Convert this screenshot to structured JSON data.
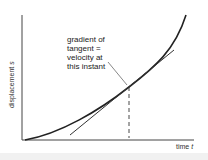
{
  "diagram": {
    "annotation_lines": [
      "gradient of",
      "tangent =",
      "velocity at",
      "this instant"
    ],
    "x_axis": {
      "label": "time",
      "symbol": "t"
    },
    "y_axis": {
      "label": "displacement",
      "symbol": "s"
    },
    "colors": {
      "curve": "#222222",
      "axes": "#444444",
      "tangent": "#333333",
      "dashed": "#333333"
    },
    "elements": [
      "curve",
      "tangent-line",
      "dashed-vertical-line",
      "leader-line"
    ]
  }
}
